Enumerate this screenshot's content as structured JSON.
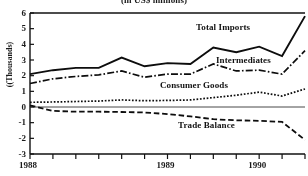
{
  "chart_data": {
    "type": "line",
    "title": "(in US$ millions)",
    "ylabel": "((Thousands)",
    "xlabel": "",
    "ylim": [
      -3,
      6
    ],
    "yticks": [
      6,
      5,
      4,
      3,
      2,
      1,
      0,
      -1,
      -2,
      -3
    ],
    "ytick_labels": [
      "6",
      "5",
      "4",
      "3",
      "2",
      "1",
      "0",
      "-1",
      "-2",
      "-3"
    ],
    "xtick_labels": [
      "1988",
      "1989",
      "1990"
    ],
    "x": [
      0,
      1,
      2,
      3,
      4,
      5,
      6,
      7,
      8,
      9,
      10,
      11,
      12
    ],
    "grid": false,
    "legend_position": "inline-annotations",
    "series": [
      {
        "name": "Total Imports",
        "style": "solid",
        "values": [
          2.1,
          2.35,
          2.5,
          2.5,
          3.15,
          2.6,
          2.8,
          2.75,
          3.8,
          3.5,
          3.85,
          3.25,
          5.8
        ]
      },
      {
        "name": "Intermediates",
        "style": "dash-dot",
        "values": [
          1.5,
          1.8,
          1.95,
          2.05,
          2.3,
          1.9,
          2.1,
          2.1,
          2.75,
          2.3,
          2.35,
          2.1,
          3.6
        ]
      },
      {
        "name": "Consumer Goods",
        "style": "dotted",
        "values": [
          0.3,
          0.32,
          0.35,
          0.38,
          0.45,
          0.4,
          0.42,
          0.45,
          0.6,
          0.75,
          0.95,
          0.7,
          1.15
        ]
      },
      {
        "name": "Trade Balance",
        "style": "dashed",
        "values": [
          0.1,
          -0.25,
          -0.3,
          -0.3,
          -0.32,
          -0.35,
          -0.45,
          -0.6,
          -0.78,
          -0.85,
          -0.88,
          -0.95,
          -2.1
        ]
      }
    ]
  },
  "annotations": [
    {
      "label": "Total Imports",
      "x": 196,
      "y": 22
    },
    {
      "label": "Intermediates",
      "x": 216,
      "y": 55
    },
    {
      "label": "Consumer Goods",
      "x": 160,
      "y": 80
    },
    {
      "label": "Trade Balance",
      "x": 178,
      "y": 120
    }
  ]
}
